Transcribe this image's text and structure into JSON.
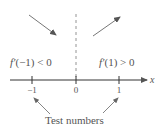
{
  "diagram": {
    "axis": {
      "variable": "x",
      "ticks": [
        {
          "value": -1,
          "label": "−1"
        },
        {
          "value": 0,
          "label": "0"
        },
        {
          "value": 1,
          "label": "1"
        }
      ]
    },
    "critical_line": {
      "at": 0,
      "style": "dashed"
    },
    "regions": [
      {
        "side": "left",
        "label_fn": "f′",
        "label_rest": "(−1) < 0",
        "label": "f′(−1) < 0",
        "direction": "decreasing"
      },
      {
        "side": "right",
        "label_fn": "f′",
        "label_rest": "(1) > 0",
        "label": "f′(1) > 0",
        "direction": "increasing"
      }
    ],
    "caption": "Test numbers",
    "colors": {
      "line": "#444444",
      "text": "#555555",
      "dashed": "#888888",
      "arrow": "#666666"
    }
  }
}
